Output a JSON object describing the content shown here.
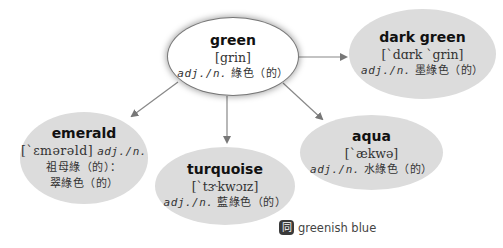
{
  "colors": {
    "main_node_bg": "#ffffff",
    "child_node_bg": "#dcdcdc",
    "arrow": "#777777",
    "text": "#333333"
  },
  "main": {
    "word": "green",
    "ipa": "[grin]",
    "pos": "adj./n.",
    "meaning": "綠色（的）"
  },
  "nodes": [
    {
      "id": "dark-green",
      "word": "dark green",
      "ipa": "[`dɑrk `grin]",
      "pos": "adj./n.",
      "meaning": "墨綠色（的）"
    },
    {
      "id": "emerald",
      "word": "emerald",
      "ipa": "[`ɛmərəld]",
      "pos": "adj./n.",
      "meaning_line1": "祖母綠（的）：",
      "meaning_line2": "翠綠色（的）"
    },
    {
      "id": "turquoise",
      "word": "turquoise",
      "ipa": "[`tɝkwɔɪz]",
      "pos": "adj./n.",
      "meaning": "藍綠色（的）"
    },
    {
      "id": "aqua",
      "word": "aqua",
      "ipa": "[`ækwə]",
      "pos": "adj./n.",
      "meaning": "水綠色（的）"
    }
  ],
  "synonym": {
    "icon": "同",
    "icon_name": "synonym-icon",
    "text": "greenish blue"
  }
}
